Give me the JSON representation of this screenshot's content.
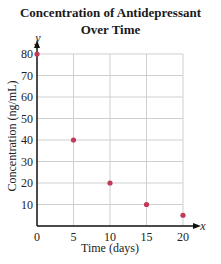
{
  "chart_data": {
    "type": "scatter",
    "title_lines": [
      "Concentration of Antidepressant",
      "Over Time"
    ],
    "xlabel": "Time (days)",
    "ylabel": "Concentration (ng/mL)",
    "x_axis_var": "x",
    "y_axis_var": "y",
    "xlim": [
      0,
      20
    ],
    "ylim": [
      0,
      80
    ],
    "xticks": [
      0,
      5,
      10,
      15,
      20
    ],
    "yticks": [
      10,
      20,
      30,
      40,
      50,
      60,
      70,
      80
    ],
    "grid": true,
    "point_color": "#c0395a",
    "points": [
      {
        "x": 0,
        "y": 80
      },
      {
        "x": 5,
        "y": 40
      },
      {
        "x": 10,
        "y": 20
      },
      {
        "x": 15,
        "y": 10
      },
      {
        "x": 20,
        "y": 5
      }
    ]
  }
}
